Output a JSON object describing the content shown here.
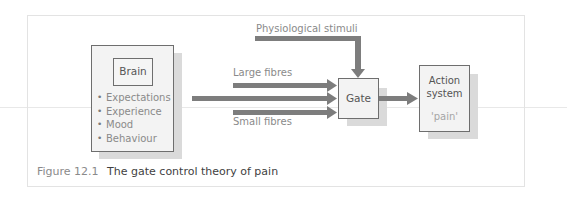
{
  "diagram": {
    "brain": {
      "label": "Brain",
      "factors": [
        "Expectations",
        "Experience",
        "Mood",
        "Behaviour"
      ]
    },
    "inputs": {
      "physiological": "Physiological stimuli",
      "large_fibres": "Large fibres",
      "small_fibres": "Small fibres"
    },
    "gate": {
      "label": "Gate"
    },
    "action_system": {
      "line1": "Action",
      "line2": "system",
      "output": "'pain'"
    },
    "colors": {
      "arrow": "#7d7d7d",
      "box_border": "#6e6e6e",
      "box_fill": "#f3f3f3",
      "shadow": "#dadada"
    }
  },
  "caption": {
    "number": "Figure 12.1",
    "title": "The gate control theory of pain"
  }
}
